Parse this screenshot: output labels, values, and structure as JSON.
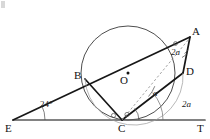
{
  "figure": {
    "width": 210,
    "height": 139,
    "background_color": "#ffffff",
    "stroke_color": "#1a1a1a",
    "thin_stroke_color": "#6f6f6f",
    "baseline_color": "#555555"
  },
  "points": {
    "A": {
      "label": "A",
      "x": 190,
      "y": 37,
      "label_x": 192,
      "label_y": 26
    },
    "B": {
      "label": "B",
      "x": 85,
      "y": 79,
      "label_x": 74,
      "label_y": 70
    },
    "C": {
      "label": "C",
      "x": 122,
      "y": 120,
      "label_x": 118,
      "label_y": 123
    },
    "D": {
      "label": "D",
      "x": 183,
      "y": 73,
      "label_x": 186,
      "label_y": 66
    },
    "E": {
      "label": "E",
      "x": 13,
      "y": 120,
      "label_x": 6,
      "label_y": 123
    },
    "O": {
      "label": "O",
      "x": 128,
      "y": 74,
      "label_x": 120,
      "label_y": 74
    },
    "T": {
      "label": "T",
      "x": 204,
      "y": 120,
      "label_x": 198,
      "label_y": 123
    }
  },
  "circle": {
    "center_x": 128,
    "center_y": 73,
    "radius": 47,
    "center_dot": true
  },
  "angles": [
    {
      "id": "angle-at-E",
      "label": "24°",
      "vertex": "E",
      "x": 40,
      "y": 101,
      "italic": false
    },
    {
      "id": "angle-at-A",
      "label": "2a",
      "vertex": "A",
      "x": 171,
      "y": 49,
      "italic": true
    },
    {
      "id": "angle-ACD",
      "label": "a",
      "vertex": "C",
      "x": 153,
      "y": 91,
      "italic": true
    },
    {
      "id": "angle-DCT",
      "label": "2a",
      "vertex": "C",
      "x": 182,
      "y": 102,
      "italic": true
    }
  ],
  "segments": [
    {
      "name": "chord-A-B",
      "from": "A",
      "to": "B",
      "style": "solid-bold"
    },
    {
      "name": "ray-B-E",
      "from": "B",
      "to": "E",
      "style": "solid-bold"
    },
    {
      "name": "chord-B-C",
      "from": "B",
      "to": "C",
      "style": "solid-bold"
    },
    {
      "name": "chord-C-D",
      "from": "C",
      "to": "D",
      "style": "solid-bold"
    },
    {
      "name": "chord-D-A",
      "from": "D",
      "to": "A",
      "style": "solid-bold"
    },
    {
      "name": "line-E-T",
      "from": "E",
      "to": "T",
      "style": "solid-base"
    },
    {
      "name": "diagonal-C-A",
      "from": "C",
      "to": "A",
      "style": "dashed"
    }
  ],
  "markers": [
    {
      "name": "right-angle-dot-at-A",
      "x": 175,
      "y": 43
    },
    {
      "name": "angle-dot-left-of-C",
      "x": 114,
      "y": 115
    },
    {
      "name": "angle-dot-right-of-C",
      "x": 127,
      "y": 114
    }
  ],
  "notes": {
    "tangent_point": "C",
    "tangent_line": "ET",
    "diameter_chord": "AB through O"
  }
}
